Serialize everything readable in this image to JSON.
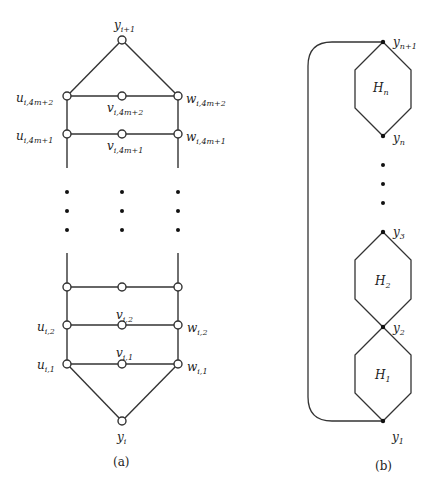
{
  "figure": {
    "panel_a": {
      "caption": "(a)",
      "labels": {
        "top": {
          "base": "y",
          "sub": "i+1"
        },
        "u_top": {
          "base": "u",
          "sub": "i,4m+2"
        },
        "v_top": {
          "base": "v",
          "sub": "i,4m+2"
        },
        "w_top": {
          "base": "w",
          "sub": "i,4m+2"
        },
        "u_2nd": {
          "base": "u",
          "sub": "i,4m+1"
        },
        "v_2nd": {
          "base": "v",
          "sub": "i,4m+1"
        },
        "w_2nd": {
          "base": "w",
          "sub": "i,4m+1"
        },
        "u_2": {
          "base": "u",
          "sub": "i,2"
        },
        "v_2": {
          "base": "v",
          "sub": "i,2"
        },
        "w_2": {
          "base": "w",
          "sub": "i,2"
        },
        "u_1": {
          "base": "u",
          "sub": "i,1"
        },
        "v_1": {
          "base": "v",
          "sub": "i,1"
        },
        "w_1": {
          "base": "w",
          "sub": "i,1"
        },
        "bottom": {
          "base": "y",
          "sub": "i"
        }
      }
    },
    "panel_b": {
      "caption": "(b)",
      "labels": {
        "yn1": {
          "base": "y",
          "sub": "n+1"
        },
        "yn": {
          "base": "y",
          "sub": "n"
        },
        "y3": {
          "base": "y",
          "sub": "3"
        },
        "y2": {
          "base": "y",
          "sub": "2"
        },
        "y1": {
          "base": "y",
          "sub": "1"
        },
        "Hn": {
          "base": "H",
          "sub": "n"
        },
        "H2": {
          "base": "H",
          "sub": "2"
        },
        "H1": {
          "base": "H",
          "sub": "1"
        }
      }
    }
  }
}
